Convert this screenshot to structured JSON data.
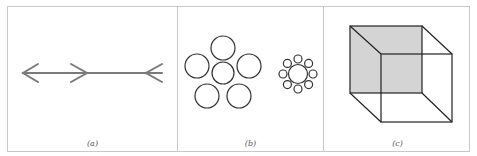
{
  "figure": {
    "panels": [
      {
        "id": "a",
        "caption": "(a)",
        "illustration": "muller-lyer-arrows"
      },
      {
        "id": "b",
        "caption": "(b)",
        "illustration": "ebbinghaus-circles"
      },
      {
        "id": "c",
        "caption": "(c)",
        "illustration": "necker-cube"
      }
    ],
    "colors": {
      "arrow_stroke": "#777777",
      "line_stroke": "#333333",
      "cube_shade": "#d4d4d4",
      "border": "#c8c8c8"
    }
  }
}
